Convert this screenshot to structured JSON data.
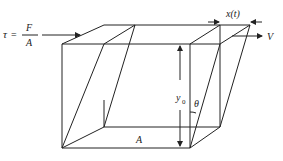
{
  "diagram": {
    "labels": {
      "tau_symbol": "τ",
      "equals": "=",
      "force": "F",
      "area_denominator": "A",
      "displacement": "x(t)",
      "velocity": "V",
      "height": "y",
      "height_subscript": "0",
      "angle": "θ",
      "base_area": "A"
    },
    "colors": {
      "line": "#222222",
      "background": "#ffffff"
    }
  }
}
